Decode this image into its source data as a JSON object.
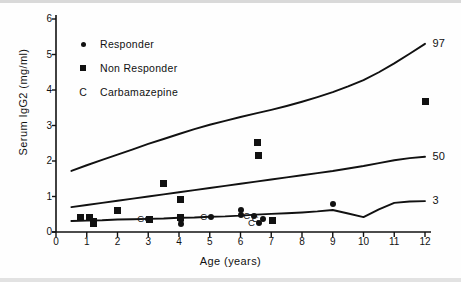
{
  "figure": {
    "title": "",
    "xlabel": "Age (years)",
    "ylabel": "Serum IgG2 (mg/ml)"
  },
  "legend": {
    "position": "upper-left-inside",
    "items": [
      {
        "marker": "circle",
        "label": "Responder"
      },
      {
        "marker": "square",
        "label": "Non Responder"
      },
      {
        "marker": "C",
        "label": "Carbamazepine"
      }
    ]
  },
  "chart_data": {
    "type": "scatter",
    "title": "",
    "xlabel": "Age (years)",
    "ylabel": "Serum IgG2 (mg/ml)",
    "xlim": [
      0,
      12
    ],
    "ylim": [
      0,
      6
    ],
    "grid": false,
    "xticks": [
      0,
      1,
      2,
      3,
      4,
      5,
      6,
      7,
      8,
      9,
      10,
      11,
      12
    ],
    "xticklabels": [
      "0",
      "1",
      "2",
      "3",
      "4",
      "5",
      "6",
      "7",
      "8",
      "9",
      "10",
      "11",
      "12"
    ],
    "yticks": [
      0,
      1,
      2,
      3,
      4,
      5,
      6
    ],
    "yticklabels": [
      "0",
      "1",
      "2",
      "3",
      "4",
      "5",
      "6"
    ],
    "legend_position": "upper left",
    "annotations": [
      {
        "text": "97",
        "x": 12.05,
        "y": 5.3
      },
      {
        "text": "50",
        "x": 12.05,
        "y": 2.12
      },
      {
        "text": "3",
        "x": 12.05,
        "y": 0.88
      }
    ],
    "series": [
      {
        "name": "97th percentile",
        "type": "line",
        "label": "97",
        "x": [
          0.5,
          1.0,
          1.5,
          2.0,
          2.5,
          3.0,
          3.5,
          4.0,
          4.5,
          5.0,
          5.5,
          6.0,
          6.5,
          7.0,
          7.5,
          8.0,
          8.5,
          9.0,
          9.5,
          10.0,
          10.5,
          11.0,
          11.5,
          12.0
        ],
        "y": [
          1.72,
          1.88,
          2.03,
          2.18,
          2.33,
          2.48,
          2.62,
          2.76,
          2.9,
          3.02,
          3.13,
          3.24,
          3.34,
          3.44,
          3.55,
          3.67,
          3.8,
          3.94,
          4.1,
          4.28,
          4.5,
          4.75,
          5.02,
          5.3
        ]
      },
      {
        "name": "50th percentile",
        "type": "line",
        "label": "50",
        "x": [
          0.5,
          1.0,
          1.5,
          2.0,
          2.5,
          3.0,
          3.5,
          4.0,
          4.5,
          5.0,
          5.5,
          6.0,
          6.5,
          7.0,
          7.5,
          8.0,
          8.5,
          9.0,
          9.5,
          10.0,
          10.5,
          11.0,
          11.5,
          12.0
        ],
        "y": [
          0.7,
          0.76,
          0.82,
          0.88,
          0.94,
          1.0,
          1.06,
          1.12,
          1.18,
          1.24,
          1.3,
          1.36,
          1.42,
          1.48,
          1.54,
          1.6,
          1.66,
          1.72,
          1.79,
          1.86,
          1.94,
          2.02,
          2.08,
          2.12
        ]
      },
      {
        "name": "3rd percentile",
        "type": "line",
        "label": "3",
        "x": [
          0.5,
          1.0,
          1.5,
          2.0,
          2.5,
          3.0,
          3.5,
          4.0,
          4.5,
          5.0,
          5.5,
          6.0,
          6.5,
          7.0,
          7.5,
          8.0,
          8.5,
          9.0,
          9.5,
          10.0,
          10.5,
          11.0,
          11.5,
          12.0
        ],
        "y": [
          0.31,
          0.32,
          0.33,
          0.35,
          0.36,
          0.37,
          0.38,
          0.4,
          0.41,
          0.43,
          0.44,
          0.46,
          0.49,
          0.51,
          0.53,
          0.55,
          0.58,
          0.62,
          0.52,
          0.42,
          0.64,
          0.82,
          0.86,
          0.87
        ]
      },
      {
        "name": "Responder",
        "type": "scatter",
        "marker": "circle",
        "points": [
          {
            "x": 3.0,
            "y": 0.38,
            "carbamazepine": true
          },
          {
            "x": 4.05,
            "y": 0.22,
            "carbamazepine": false
          },
          {
            "x": 4.05,
            "y": 0.33,
            "carbamazepine": false
          },
          {
            "x": 5.05,
            "y": 0.42,
            "carbamazepine": true
          },
          {
            "x": 6.0,
            "y": 0.62,
            "carbamazepine": false
          },
          {
            "x": 6.0,
            "y": 0.49,
            "carbamazepine": false
          },
          {
            "x": 6.45,
            "y": 0.45,
            "carbamazepine": true
          },
          {
            "x": 6.72,
            "y": 0.36,
            "carbamazepine": true
          },
          {
            "x": 6.6,
            "y": 0.25,
            "carbamazepine": true
          },
          {
            "x": 9.0,
            "y": 0.8,
            "carbamazepine": false
          }
        ]
      },
      {
        "name": "Non Responder",
        "type": "scatter",
        "marker": "square",
        "points": [
          {
            "x": 0.8,
            "y": 0.4
          },
          {
            "x": 1.1,
            "y": 0.42
          },
          {
            "x": 1.22,
            "y": 0.3
          },
          {
            "x": 1.22,
            "y": 0.24
          },
          {
            "x": 2.0,
            "y": 0.6
          },
          {
            "x": 3.05,
            "y": 0.36
          },
          {
            "x": 3.5,
            "y": 1.38
          },
          {
            "x": 4.05,
            "y": 0.92
          },
          {
            "x": 4.05,
            "y": 0.4
          },
          {
            "x": 6.55,
            "y": 2.52
          },
          {
            "x": 6.58,
            "y": 2.15
          },
          {
            "x": 7.05,
            "y": 0.33
          },
          {
            "x": 12.0,
            "y": 3.68
          }
        ]
      }
    ]
  }
}
